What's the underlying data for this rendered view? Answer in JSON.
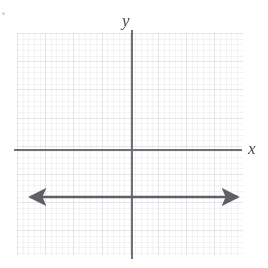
{
  "figure": {
    "kind": "coordinate-plane-graph",
    "width": 268,
    "height": 268,
    "background": "#ffffff"
  },
  "labels": {
    "y_axis": "y",
    "x_axis": "x"
  },
  "colors": {
    "axis": "#6f6f77",
    "plot_line": "#5f5f68",
    "grid_major": "#8c8c96",
    "grid_minor": "#a0a0aa",
    "label": "#4a4a52"
  },
  "grid": {
    "left_px": 17,
    "top_px": 33,
    "width_px": 226,
    "height_px": 222,
    "minor_cell_px": 5.64,
    "major_cell_px": 28.2,
    "minor_per_major": 5,
    "style": "dotted",
    "visible": true
  },
  "axes": {
    "y_axis": {
      "x_px": 131,
      "top_px": 30,
      "bottom_px": 259,
      "arrowheads": "none"
    },
    "x_axis": {
      "y_px": 149,
      "left_px": 14,
      "right_px": 242,
      "arrowheads": "none"
    }
  },
  "chart_data": {
    "type": "line",
    "title": "",
    "xlabel": "x",
    "ylabel": "y",
    "grid": true,
    "legend": "none",
    "xlim": [
      -8,
      8
    ],
    "ylim": [
      -8,
      8
    ],
    "series": [
      {
        "name": "horizontal line",
        "kind": "horizontal-line",
        "equation": "y = -1.6",
        "y_value": -1.6,
        "slope": 0,
        "x": [
          -8,
          8
        ],
        "values": [
          -1.6,
          -1.6
        ],
        "color": "#5f5f68",
        "arrow_start": true,
        "arrow_end": true,
        "pixel_y": 197,
        "pixel_x_start": 22,
        "pixel_x_end": 246
      }
    ],
    "annotations": []
  }
}
